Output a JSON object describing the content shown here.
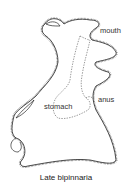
{
  "diagram": {
    "caption": "Late bipinnaria",
    "labels": {
      "mouth": "mouth",
      "anus": "anus",
      "stomach": "stomach"
    },
    "colors": {
      "outline": "#222222",
      "cilia": "#555555",
      "gut": "#555555",
      "text": "#333333"
    }
  }
}
